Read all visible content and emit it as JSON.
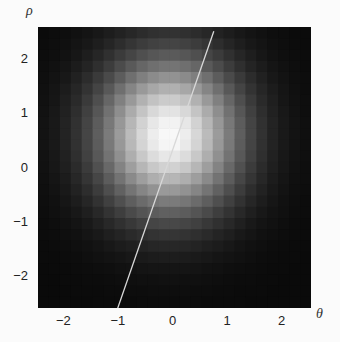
{
  "chart_data": {
    "type": "heatmap",
    "title": "",
    "xlabel": "θ",
    "ylabel": "ρ",
    "xlim": [
      -2.5,
      2.5
    ],
    "ylim": [
      -2.6,
      2.6
    ],
    "x_ticks": [
      -2,
      -1,
      0,
      1,
      2
    ],
    "y_ticks": [
      2,
      1,
      0,
      -1,
      -2
    ],
    "x_tick_labels": [
      "−2",
      "−1",
      "0",
      "1",
      "2"
    ],
    "y_tick_labels": [
      "2",
      "1",
      "0",
      "−1",
      "−2"
    ],
    "grid": false,
    "colormap": "grayscale (black = low, white = high)",
    "heatmap": {
      "grid_cells": 25,
      "peak_center": {
        "theta": -0.1,
        "rho": 0.6
      },
      "sigma_theta": 0.85,
      "sigma_rho": 0.95,
      "peak_value": 1.0
    },
    "overlay_line": {
      "color": "#d8d8d8",
      "points": [
        {
          "theta": 0.72,
          "rho": 2.52
        },
        {
          "theta": -1.07,
          "rho": -2.69
        }
      ]
    }
  },
  "axes": {
    "x_label": "θ",
    "y_label": "ρ"
  }
}
